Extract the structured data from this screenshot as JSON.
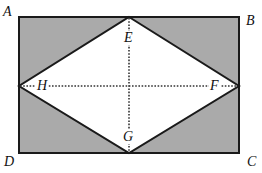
{
  "figure": {
    "type": "geometry-diagram",
    "colors": {
      "shade": "#aaaaaa",
      "stroke": "#1a1a1a",
      "inner_fill": "#ffffff",
      "dotted": "#333333"
    },
    "rectangle": {
      "vertices": [
        "A",
        "B",
        "C",
        "D"
      ],
      "x": 19,
      "y": 17,
      "width": 220,
      "height": 136
    },
    "rhombus": {
      "vertices": [
        "E",
        "F",
        "G",
        "H"
      ]
    },
    "dotted_segments": [
      {
        "from": "E",
        "to": "G"
      },
      {
        "from": "H",
        "to": "F"
      }
    ],
    "shaded_regions": [
      "triangle A-E-H",
      "triangle E-B-F",
      "triangle F-C-G",
      "triangle G-D-H"
    ]
  },
  "labels": {
    "A": "A",
    "B": "B",
    "C": "C",
    "D": "D",
    "E": "E",
    "F": "F",
    "G": "G",
    "H": "H"
  }
}
